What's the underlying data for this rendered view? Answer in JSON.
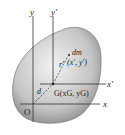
{
  "diagram": {
    "labels": {
      "y_axis": "y",
      "y_prime_axis": "y′",
      "x_axis": "x",
      "x_prime_axis": "x′",
      "origin": "O",
      "centroid": "G(xG, yG)",
      "mass_element": "dm",
      "mass_coords": "(x′, y′)",
      "r_vector": "r′",
      "d_vector": "d"
    },
    "colors": {
      "body_fill": "#c8c8c8",
      "axis": "#333333"
    }
  }
}
